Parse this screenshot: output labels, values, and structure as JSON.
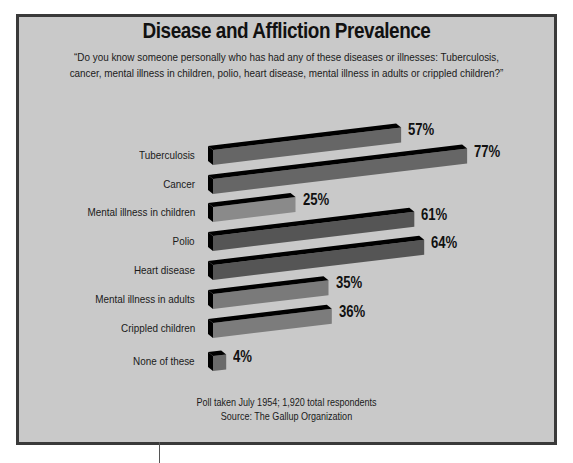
{
  "title": "Disease and Affliction Prevalence",
  "subtitle": "“Do you know someone personally who has had any of these diseases or illnesses: Tuberculosis, cancer, mental illness in children, polio, heart disease, mental illness in adults or crippled children?”",
  "footer": {
    "line1": "Poll taken July 1954; 1,920 total respondents",
    "line2": "Source: The Gallup Organization"
  },
  "chart_data": {
    "type": "bar",
    "orientation": "horizontal",
    "title": "Disease and Affliction Prevalence",
    "subtitle": "“Do you know someone personally who has had any of these diseases or illnesses: Tuberculosis, cancer, mental illness in children, polio, heart disease, mental illness in adults or crippled children?”",
    "categories": [
      "Tuberculosis",
      "Cancer",
      "Mental illness in children",
      "Polio",
      "Heart disease",
      "Mental illness in adults",
      "Crippled children",
      "None of these"
    ],
    "values": [
      57,
      77,
      25,
      61,
      64,
      35,
      36,
      4
    ],
    "value_labels": [
      "57%",
      "77%",
      "25%",
      "61%",
      "64%",
      "35%",
      "36%",
      "4%"
    ],
    "unit": "%",
    "xlabel": "",
    "ylabel": "",
    "xlim": [
      0,
      100
    ],
    "grid": false,
    "legend": null,
    "style": "3d-skewed",
    "bar_colors": [
      "#666666",
      "#666666",
      "#8a8a8a",
      "#555555",
      "#555555",
      "#7a7a7a",
      "#7c7c7c",
      "#6a6a6a"
    ],
    "annotations": [
      "Poll taken July 1954; 1,920 total respondents",
      "Source: The Gallup Organization"
    ]
  },
  "colors": {
    "background": "#c9c9c9",
    "frame_border": "#3a3a3a",
    "bar_side": "#000000"
  }
}
